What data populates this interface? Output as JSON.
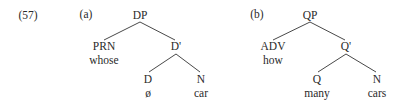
{
  "example_number": "(57)",
  "trees": [
    {
      "label": "(a)",
      "root": "DP",
      "spec": {
        "category": "PRN",
        "word": "whose"
      },
      "bar": "D'",
      "head": {
        "category": "D",
        "word": "ø"
      },
      "complement": {
        "category": "N",
        "word": "car"
      }
    },
    {
      "label": "(b)",
      "root": "QP",
      "spec": {
        "category": "ADV",
        "word": "how"
      },
      "bar": "Q'",
      "head": {
        "category": "Q",
        "word": "many"
      },
      "complement": {
        "category": "N",
        "word": "cars"
      }
    }
  ]
}
